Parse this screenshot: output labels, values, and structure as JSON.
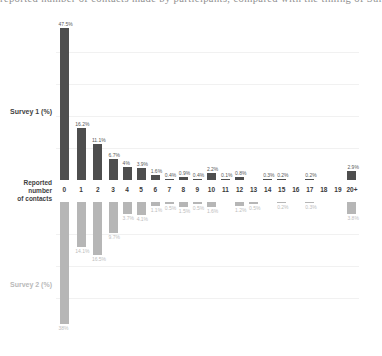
{
  "caption_clipped": "reported number of contacts made by participants, compared with the timing of Survey",
  "labels": {
    "survey1": "Survey 1 (%)",
    "axis_line1": "Reported number",
    "axis_line2": "of contacts",
    "survey2": "Survey 2 (%)"
  },
  "colors": {
    "survey1_bar": "#4e4e4e",
    "survey1_value_label": "#595959",
    "survey2_bar": "#b6b6b6",
    "survey2_value_label": "#bdbdbd",
    "tick_text": "#3a3a3a",
    "gridline": "#f1f1f1"
  },
  "chart_data": {
    "type": "bar",
    "orientation": "diverging-vertical",
    "title": "",
    "xlabel": "Reported number of contacts",
    "ylabel": "%",
    "categories": [
      "0",
      "1",
      "2",
      "3",
      "4",
      "5",
      "6",
      "7",
      "8",
      "9",
      "10",
      "11",
      "12",
      "13",
      "14",
      "15",
      "16",
      "17",
      "18",
      "19",
      "20+"
    ],
    "series": [
      {
        "name": "Survey 1 (%)",
        "direction": "up",
        "values": [
          47.5,
          16.2,
          11.1,
          6.7,
          4,
          3.9,
          1.6,
          0.4,
          0.9,
          0.4,
          2.2,
          0.1,
          0.8,
          0,
          0.3,
          0.2,
          0,
          0.2,
          0,
          0,
          2.9
        ]
      },
      {
        "name": "Survey 2 (%)",
        "direction": "down",
        "values": [
          38,
          14.1,
          16.5,
          9.7,
          3.7,
          4.1,
          1.1,
          0.5,
          1.5,
          0.5,
          1.6,
          0,
          1.2,
          0.5,
          0,
          0.2,
          0,
          0.3,
          0,
          0,
          3.8
        ]
      }
    ],
    "value_label_format": "{value}%",
    "gridlines_pct_top": [
      10,
      20,
      30,
      40
    ],
    "gridlines_pct_bottom": [
      10,
      20,
      30
    ],
    "px_per_percent": 3.2,
    "grid": true,
    "legend_position": "none"
  }
}
